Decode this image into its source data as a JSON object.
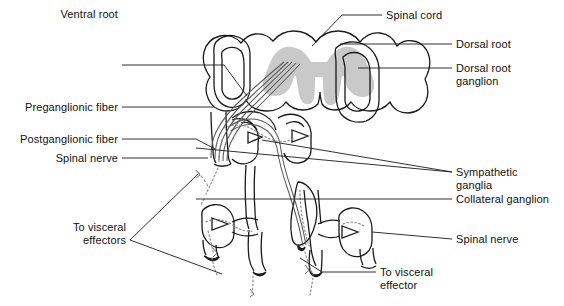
{
  "figure": {
    "width": 564,
    "height": 306,
    "background_color": "#ffffff",
    "stroke_color": "#1a1a1a",
    "gray_matter_color": "#c9c9c9",
    "fiber_color": "#5a5a5a",
    "dotted_fiber_color": "#8a8a8a"
  },
  "labels": {
    "spinal_cord": "Spinal cord",
    "dorsal_root": "Dorsal root",
    "dorsal_root_ganglion": "Dorsal root\nganglion",
    "ventral_root": "Ventral root",
    "preganglionic_fiber": "Preganglionic fiber",
    "postganglionic_fiber": "Postganglionic fiber",
    "spinal_nerve_left": "Spinal nerve",
    "sympathetic_ganglia": "Sympathetic\nganglia",
    "collateral_ganglion": "Collateral ganglion",
    "spinal_nerve_right": "Spinal nerve",
    "to_visceral_effectors": "To visceral\neffectors",
    "to_visceral_effector": "To visceral\neffector"
  }
}
